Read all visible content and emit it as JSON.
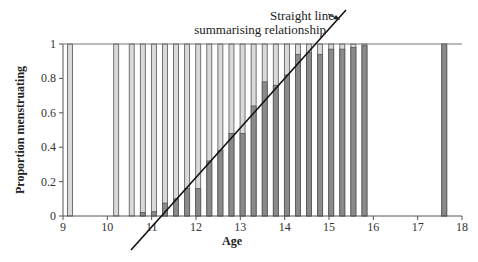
{
  "chart_data": {
    "type": "bar",
    "title": "",
    "xlabel": "Age",
    "ylabel": "Proportion menstruating",
    "xlim": [
      9,
      18
    ],
    "ylim": [
      0,
      1
    ],
    "xticks": [
      "9",
      "10",
      "11",
      "12",
      "13",
      "14",
      "15",
      "16",
      "17",
      "18"
    ],
    "yticks": [
      "0",
      "0.2",
      "0.4",
      "0.6",
      "0.8",
      "1"
    ],
    "grid": false,
    "legend": null,
    "x": [
      9.16,
      10.2,
      10.55,
      10.8,
      11.05,
      11.3,
      11.55,
      11.8,
      12.05,
      12.3,
      12.55,
      12.8,
      13.05,
      13.3,
      13.55,
      13.8,
      14.05,
      14.3,
      14.55,
      14.8,
      15.05,
      15.3,
      15.55,
      15.8,
      17.6
    ],
    "values": [
      0,
      0,
      0,
      0.02,
      0.025,
      0.075,
      0.1,
      0.16,
      0.16,
      0.32,
      0.38,
      0.48,
      0.48,
      0.64,
      0.78,
      0.76,
      0.82,
      0.94,
      0.95,
      0.94,
      0.97,
      0.97,
      0.98,
      0.99,
      1.0
    ],
    "series": [
      {
        "name": "Proportion menstruating (dark fill)",
        "values": [
          0,
          0,
          0,
          0.02,
          0.025,
          0.075,
          0.1,
          0.16,
          0.16,
          0.32,
          0.38,
          0.48,
          0.48,
          0.64,
          0.78,
          0.76,
          0.82,
          0.94,
          0.95,
          0.94,
          0.97,
          0.97,
          0.98,
          0.99,
          1.0
        ]
      },
      {
        "name": "Proportion not menstruating (light fill)",
        "values": [
          1,
          1,
          1,
          0.98,
          0.975,
          0.925,
          0.9,
          0.84,
          0.84,
          0.68,
          0.62,
          0.52,
          0.52,
          0.36,
          0.22,
          0.24,
          0.18,
          0.06,
          0.05,
          0.06,
          0.03,
          0.03,
          0.02,
          0.01,
          0.0
        ]
      }
    ],
    "fit_line": {
      "label": "Straight line summarising relationship",
      "from": [
        10.55,
        -0.2
      ],
      "to": [
        15.5,
        1.2
      ]
    },
    "annotations": [
      {
        "text_line1": "Straight line",
        "text_line2": "summarising relationship",
        "arrow_to": "fit line"
      }
    ],
    "colors": {
      "dark": "#8a8a8a",
      "light": "#d9d9d9",
      "outline": "#555555",
      "line": "#111111"
    }
  },
  "labels": {
    "xlabel": "Age",
    "ylabel": "Proportion menstruating",
    "annot1": "Straight line",
    "annot2": "summarising relationship"
  }
}
